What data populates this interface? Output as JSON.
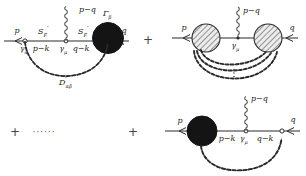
{
  "figure": {
    "background": "#ffffff",
    "line_color": "#2b2b2b",
    "blob_fill_dark": "#141414",
    "blob_fill_hatched": "#e8e8e8",
    "hatch_color": "#3a3a3a",
    "operators": {
      "plus_1": "+",
      "plus_2": "+",
      "plus_3": "+",
      "ellipsis": "······"
    },
    "terms": [
      {
        "id": "term-1",
        "name": "vertex-correction-diagram",
        "labels": {
          "in_momentum": "p",
          "out_momentum": "q",
          "photon_momentum": "p−q",
          "left_propagator": "S",
          "left_propagator_sub": "F",
          "left_propagator_prime": "′",
          "right_propagator": "S",
          "right_propagator_sub": "F",
          "right_propagator_prime": "′",
          "left_internal_momentum": "p−k",
          "right_internal_momentum": "q−k",
          "left_vertex": "γ",
          "left_vertex_sub": "α",
          "middle_vertex": "γ",
          "middle_vertex_sub": "μ",
          "blob_label": "Γ",
          "blob_label_sub": "β",
          "photon_propagator": "D",
          "photon_propagator_prime": "′",
          "photon_propagator_sub": "αβ"
        }
      },
      {
        "id": "term-2",
        "name": "multi-photon-exchange-diagram",
        "labels": {
          "in_momentum": "p",
          "out_momentum": "q",
          "photon_momentum": "p−q",
          "middle_vertex": "γ",
          "middle_vertex_sub": "μ"
        },
        "arc_count": 3,
        "vertical_dots": "⋮"
      },
      {
        "id": "term-3",
        "name": "self-energy-blob-diagram",
        "labels": {
          "in_momentum": "p",
          "out_momentum": "q",
          "photon_momentum": "p−q",
          "left_internal_momentum": "p−k",
          "right_internal_momentum": "q−k",
          "middle_vertex": "γ",
          "middle_vertex_sub": "μ"
        }
      }
    ]
  }
}
